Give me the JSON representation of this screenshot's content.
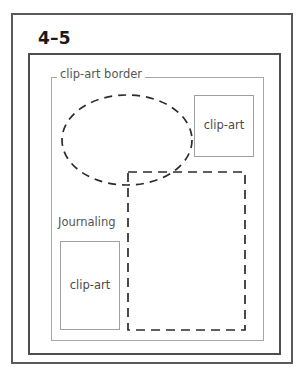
{
  "diagram": {
    "title": "4–5",
    "type": "page-layout-template",
    "frames": {
      "outer_frame_name": "page-outer-frame",
      "middle_frame_name": "page-middle-frame",
      "inner_frame_name": "clip-art-border-frame"
    },
    "labels": {
      "clip_art_border": "clip-art border",
      "journaling": "Journaling"
    },
    "placeholders": [
      {
        "id": "clipart-top-right",
        "label": "clip-art",
        "shape": "rectangle",
        "style": "solid",
        "x": 194,
        "y": 95,
        "width": 60,
        "height": 62
      },
      {
        "id": "clipart-bottom-left",
        "label": "clip-art",
        "shape": "rectangle",
        "style": "solid",
        "x": 60,
        "y": 241,
        "width": 60,
        "height": 89
      },
      {
        "id": "photo-ellipse",
        "label": "",
        "shape": "ellipse",
        "style": "dashed",
        "cx": 127,
        "cy": 140,
        "rx": 65,
        "ry": 45
      },
      {
        "id": "photo-rectangle",
        "label": "",
        "shape": "rectangle",
        "style": "dashed",
        "x": 128,
        "y": 172,
        "width": 117,
        "height": 158
      }
    ],
    "colors": {
      "outer_border": "#5a5a5a",
      "middle_border": "#4e4e4e",
      "inner_border": "#a8a8a8",
      "clipart_border": "#a0a0a0",
      "dashed_stroke": "#2b2b2b",
      "label_text": "#555555",
      "title_text": "#1a1a1a",
      "background": "#ffffff"
    }
  }
}
